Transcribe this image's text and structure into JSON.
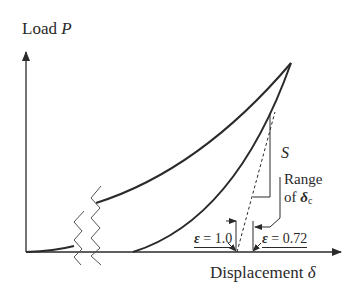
{
  "diagram": {
    "y_axis": {
      "label_text": "Load ",
      "label_symbol": "P"
    },
    "x_axis": {
      "label_text": "Displacement ",
      "label_symbol": "δ"
    },
    "annotations": {
      "slope_label": "S",
      "range_line1": "Range",
      "range_line2_text": "of ",
      "range_line2_symbol": "δ",
      "range_line2_sub": "c",
      "epsilon_left_symbol": "ε",
      "epsilon_left_value": " = 1.0",
      "epsilon_right_symbol": "ε",
      "epsilon_right_value": " = 0.72"
    },
    "colors": {
      "line": "#2a2a2a",
      "background": "#ffffff"
    }
  }
}
